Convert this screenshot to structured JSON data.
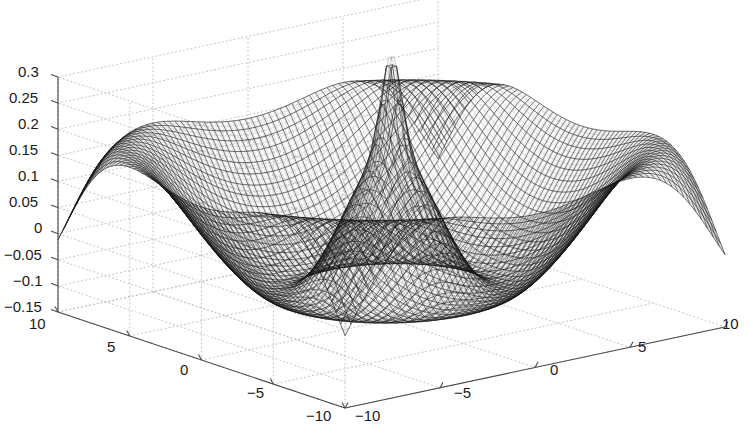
{
  "figure": {
    "type": "matlab-mesh-surface-plot",
    "background_color": "#ffffff",
    "mesh_color": "#1c1c1c",
    "grid_color": "#c0c0c0",
    "axis_color": "#4a4a4a",
    "text_color": "#1a1a1a"
  },
  "chart_data": {
    "type": "surface",
    "title": "",
    "xlabel": "",
    "ylabel": "",
    "zlabel": "",
    "grid": true,
    "legend": null,
    "projection": {
      "azimuth_deg": -37.5,
      "elevation_deg": 30,
      "style": "wireframe-mesh"
    },
    "x": {
      "ticks": [
        -10,
        -5,
        0,
        5,
        10
      ],
      "tick_labels": [
        "-10",
        "-5",
        "0",
        "5",
        "10"
      ],
      "range": [
        -10,
        10
      ],
      "axis_position": "front-right"
    },
    "y": {
      "ticks": [
        -10,
        -5,
        0,
        5,
        10
      ],
      "tick_labels": [
        "-10",
        "-5",
        "0",
        "5",
        "10"
      ],
      "range": [
        -10,
        10
      ],
      "axis_position": "front-left"
    },
    "z": {
      "ticks": [
        -0.15,
        -0.1,
        -0.05,
        0,
        0.05,
        0.1,
        0.15,
        0.2,
        0.25,
        0.3
      ],
      "tick_labels": [
        "-0.15",
        "-0.1",
        "-0.05",
        "0",
        "0.05",
        "0.1",
        "0.15",
        "0.2",
        "0.25",
        "0.3"
      ],
      "range": [
        -0.15,
        0.3
      ],
      "axis_position": "left"
    },
    "surface": {
      "description": "Radially symmetric oscillatory function with sharp central singular spike, an inner annular plateau near z=0.10, a ring-shaped depression near z=-0.02, and four raised corner lobes rising to about z=0.12 with thin tapering edges descending to about z=-0.05 at the extreme corners.",
      "grid_resolution": [
        64,
        64
      ],
      "z_peak_center": 0.26,
      "z_plateau": 0.105,
      "z_ring_min": -0.03,
      "z_corner_lobe": 0.12,
      "z_corner_edge": -0.05
    },
    "z_tick_pixel_y": {
      "0.3": 70,
      "0.25": 96,
      "0.2": 122,
      "0.15": 148,
      "0.1": 174,
      "0.05": 200,
      "0": 226,
      "-0.05": 253,
      "-0.1": 279,
      "-0.15": 305
    }
  },
  "axis_labels": {
    "z": [
      {
        "text": "0.3",
        "x": 18,
        "y": 63
      },
      {
        "text": "0.25",
        "x": 9,
        "y": 89
      },
      {
        "text": "0.2",
        "x": 18,
        "y": 115
      },
      {
        "text": "0.15",
        "x": 9,
        "y": 141
      },
      {
        "text": "0.1",
        "x": 18,
        "y": 167
      },
      {
        "text": "0.05",
        "x": 9,
        "y": 193
      },
      {
        "text": "0",
        "x": 34,
        "y": 219
      },
      {
        "text": "-0.05",
        "x": 4,
        "y": 246
      },
      {
        "text": "-0.1",
        "x": 13,
        "y": 272
      },
      {
        "text": "-0.15",
        "x": 4,
        "y": 298
      }
    ],
    "y_left": [
      {
        "text": "10",
        "x": 29,
        "y": 315
      },
      {
        "text": "5",
        "x": 107,
        "y": 338
      },
      {
        "text": "0",
        "x": 180,
        "y": 361
      },
      {
        "text": "-5",
        "x": 247,
        "y": 384
      },
      {
        "text": "-10",
        "x": 306,
        "y": 407
      }
    ],
    "x_right": [
      {
        "text": "-10",
        "x": 355,
        "y": 407
      },
      {
        "text": "-5",
        "x": 454,
        "y": 384
      },
      {
        "text": "0",
        "x": 550,
        "y": 361
      },
      {
        "text": "5",
        "x": 638,
        "y": 338
      },
      {
        "text": "10",
        "x": 722,
        "y": 315
      }
    ]
  }
}
